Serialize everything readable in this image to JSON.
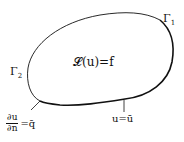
{
  "diagram": {
    "domain_equation": "𝓛(u)=f",
    "boundary_1_label": "Γ",
    "boundary_1_sub": "1",
    "boundary_2_label": "Γ",
    "boundary_2_sub": "2",
    "dirichlet_condition": "u=ū",
    "neumann_numerator": "∂u",
    "neumann_denominator": "∂n",
    "neumann_rhs": "=q̄",
    "stroke_color": "#111111"
  }
}
